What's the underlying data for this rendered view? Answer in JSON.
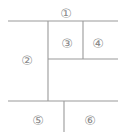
{
  "diagram": {
    "canvas": {
      "width": 128,
      "height": 137,
      "background": "#ffffff"
    },
    "line_color": "#9a9a9a",
    "label_color": "#8a8a8a",
    "segments": [
      {
        "name": "top-horizontal-rule",
        "orientation": "horizontal",
        "x1": 8,
        "y1": 21,
        "x2": 118,
        "y2": 21
      },
      {
        "name": "middle-horizontal-rule",
        "orientation": "horizontal",
        "x1": 48,
        "y1": 59,
        "x2": 118,
        "y2": 59
      },
      {
        "name": "bottom-horizontal-rule",
        "orientation": "horizontal",
        "x1": 8,
        "y1": 101,
        "x2": 118,
        "y2": 101
      },
      {
        "name": "main-vertical-divider",
        "orientation": "vertical",
        "x1": 48,
        "y1": 21,
        "x2": 48,
        "y2": 101
      },
      {
        "name": "upper-right-vertical-divider",
        "orientation": "vertical",
        "x1": 83,
        "y1": 21,
        "x2": 83,
        "y2": 59
      },
      {
        "name": "lower-vertical-divider",
        "orientation": "vertical",
        "x1": 64,
        "y1": 101,
        "x2": 64,
        "y2": 132
      }
    ],
    "regions": [
      {
        "id": "1",
        "label": "①",
        "x": 66,
        "y": 14
      },
      {
        "id": "2",
        "label": "②",
        "x": 27,
        "y": 61
      },
      {
        "id": "3",
        "label": "③",
        "x": 67,
        "y": 44
      },
      {
        "id": "4",
        "label": "④",
        "x": 98,
        "y": 44
      },
      {
        "id": "5",
        "label": "⑤",
        "x": 38,
        "y": 121
      },
      {
        "id": "6",
        "label": "⑥",
        "x": 90,
        "y": 121
      }
    ]
  }
}
